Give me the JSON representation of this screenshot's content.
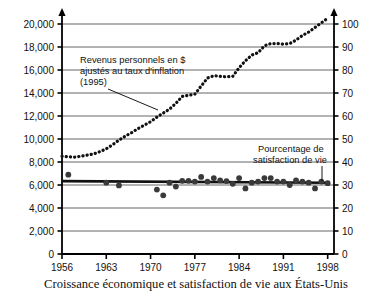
{
  "chart_data": {
    "type": "line",
    "title": "",
    "caption": "Croissance économique et satisfaction de vie aux États-Unis",
    "xlabel": "",
    "ylabel": "",
    "xlim": [
      1956,
      1999
    ],
    "x_ticks": [
      "1956",
      "1963",
      "1970",
      "1977",
      "1984",
      "1991",
      "1998"
    ],
    "x_tick_values": [
      1956,
      1963,
      1970,
      1977,
      1984,
      1991,
      1998
    ],
    "grid": true,
    "legend": "none",
    "left_axis": {
      "label": "Revenus personnels en $ ajustés au taux d'inflation (1995)",
      "ylim": [
        0,
        20000
      ],
      "ticks": [
        "0",
        "2,000",
        "4,000",
        "6,000",
        "8,000",
        "10,000",
        "12,000",
        "14,000",
        "16,000",
        "18,000",
        "20,000"
      ],
      "tick_values": [
        0,
        2000,
        4000,
        6000,
        8000,
        10000,
        12000,
        14000,
        16000,
        18000,
        20000
      ]
    },
    "right_axis": {
      "label": "Pourcentage de satisfaction de vie",
      "ylim": [
        0,
        100
      ],
      "ticks": [
        "0",
        "10",
        "20",
        "30",
        "40",
        "50",
        "60",
        "70",
        "80",
        "90",
        "100"
      ],
      "tick_values": [
        0,
        10,
        20,
        30,
        40,
        50,
        60,
        70,
        80,
        90,
        100
      ]
    },
    "annotations": [
      {
        "name": "income-annotation",
        "lines": [
          "Revenus personnels en $",
          "ajustés au taux d'inflation",
          "(1995)"
        ],
        "leader": "line to income curve near 1971"
      },
      {
        "name": "satisfaction-annotation",
        "lines": [
          "Pourcentage de",
          "satisfaction de vie"
        ],
        "leader": "vertical line down to satisfaction trend near 1996"
      }
    ],
    "series": [
      {
        "name": "Revenus personnels en $ ajustés au taux d'inflation (1995)",
        "axis": "left",
        "style": "dotted",
        "color": "#111111",
        "x": [
          1956,
          1957,
          1958,
          1959,
          1960,
          1961,
          1962,
          1963,
          1964,
          1965,
          1966,
          1967,
          1968,
          1969,
          1970,
          1971,
          1972,
          1973,
          1974,
          1975,
          1976,
          1977,
          1978,
          1979,
          1980,
          1981,
          1982,
          1983,
          1984,
          1985,
          1986,
          1987,
          1988,
          1989,
          1990,
          1991,
          1992,
          1993,
          1994,
          1995,
          1996,
          1997,
          1998
        ],
        "values": [
          8500,
          8450,
          8430,
          8500,
          8600,
          8700,
          8900,
          9150,
          9500,
          9900,
          10250,
          10550,
          10900,
          11200,
          11500,
          11900,
          12250,
          12600,
          13100,
          13700,
          13800,
          13900,
          14600,
          15300,
          15500,
          15450,
          15400,
          15450,
          16200,
          16800,
          17300,
          17500,
          18100,
          18300,
          18300,
          18250,
          18300,
          18600,
          19000,
          19300,
          19700,
          20100,
          20500
        ]
      },
      {
        "name": "Pourcentage de satisfaction de vie",
        "axis": "right",
        "style": "scatter",
        "color": "#3a3a3a",
        "x": [
          1957,
          1963,
          1965,
          1971,
          1972,
          1973,
          1974,
          1975,
          1976,
          1977,
          1978,
          1979,
          1980,
          1981,
          1982,
          1983,
          1984,
          1985,
          1986,
          1987,
          1988,
          1989,
          1990,
          1991,
          1992,
          1993,
          1994,
          1995,
          1996,
          1997,
          1998
        ],
        "values": [
          34.5,
          31.0,
          29.8,
          28.0,
          25.5,
          31.0,
          29.3,
          31.8,
          31.8,
          31.5,
          33.5,
          31.5,
          33.0,
          32.0,
          31.7,
          30.5,
          33.0,
          28.5,
          31.0,
          31.5,
          33.0,
          33.0,
          31.5,
          31.5,
          30.0,
          32.0,
          31.5,
          31.0,
          28.5,
          31.5,
          30.8
        ]
      },
      {
        "name": "Satisfaction trend line",
        "axis": "right",
        "style": "solid-thick",
        "color": "#111111",
        "x": [
          1956,
          1998
        ],
        "values": [
          31.7,
          31.0
        ]
      }
    ]
  }
}
